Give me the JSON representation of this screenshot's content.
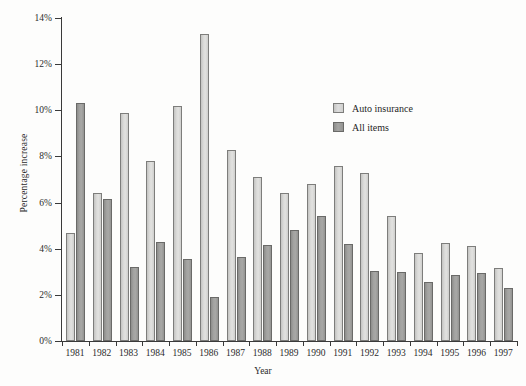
{
  "chart_data": {
    "type": "bar",
    "title": "",
    "xlabel": "Year",
    "ylabel": "Percentage increase",
    "categories": [
      "1981",
      "1982",
      "1983",
      "1984",
      "1985",
      "1986",
      "1987",
      "1988",
      "1989",
      "1990",
      "1991",
      "1992",
      "1993",
      "1994",
      "1995",
      "1996",
      "1997"
    ],
    "series": [
      {
        "name": "Auto insurance",
        "color": "#d9d9d7",
        "values": [
          4.7,
          6.4,
          9.9,
          7.8,
          10.2,
          13.3,
          8.3,
          7.1,
          6.4,
          6.8,
          7.6,
          7.3,
          5.4,
          3.8,
          4.25,
          4.1,
          3.15
        ]
      },
      {
        "name": "All items",
        "color": "#a2a2a0",
        "values": [
          10.3,
          6.15,
          3.2,
          4.3,
          3.55,
          1.9,
          3.65,
          4.15,
          4.8,
          5.4,
          4.2,
          3.05,
          3.0,
          2.55,
          2.85,
          2.95,
          2.3
        ]
      }
    ],
    "ylim": [
      0,
      14
    ],
    "ytick_values": [
      0,
      2,
      4,
      6,
      8,
      10,
      12,
      14
    ],
    "ytick_labels": [
      "0%",
      "2%",
      "4%",
      "6%",
      "8%",
      "10%",
      "12%",
      "14%"
    ],
    "grid": false,
    "legend_position": "upper right"
  },
  "legend": {
    "entries": [
      {
        "label": "Auto insurance",
        "swatch": "light"
      },
      {
        "label": "All items",
        "swatch": "dark"
      }
    ]
  },
  "axes": {
    "y_title": "Percentage increase",
    "x_title": "Year"
  }
}
